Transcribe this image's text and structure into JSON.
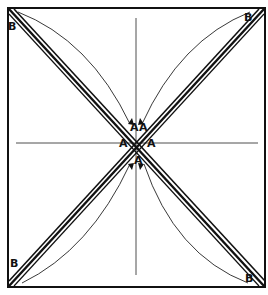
{
  "diagram": {
    "labels": {
      "corner_top_left": "B",
      "corner_top_right": "B",
      "corner_bottom_left": "B",
      "corner_bottom_right": "B",
      "center_left": "A",
      "center_right": "A",
      "center_top_left": "A",
      "center_top_right": "A",
      "center_bottom_left": "A",
      "center_bottom_right": "A"
    },
    "colors": {
      "stroke": "#111111",
      "background": "#ffffff"
    }
  }
}
